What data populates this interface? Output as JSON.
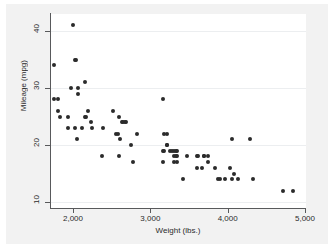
{
  "chart_data": {
    "type": "scatter",
    "title": "",
    "xlabel": "Weight (lbs.)",
    "ylabel": "Mileage (mpg)",
    "xlim": [
      1500,
      5050
    ],
    "ylim": [
      10,
      42
    ],
    "xticks": [
      2000,
      3000,
      4000,
      5000
    ],
    "xticklabels": [
      "2,000",
      "3,000",
      "4,000",
      "5,000"
    ],
    "yticks": [
      10,
      20,
      30,
      40
    ],
    "yticklabels": [
      "10",
      "20",
      "30",
      "40"
    ],
    "grid": "horizontal",
    "legend": "none",
    "marker_color": "#2b2b2b",
    "plot_background": "#ffffff",
    "graph_background": "#f2f2f2",
    "points": [
      {
        "x": 1760,
        "y": 34
      },
      {
        "x": 1760,
        "y": 28
      },
      {
        "x": 1800,
        "y": 28
      },
      {
        "x": 1800,
        "y": 26
      },
      {
        "x": 1830,
        "y": 25
      },
      {
        "x": 1930,
        "y": 25
      },
      {
        "x": 1980,
        "y": 30
      },
      {
        "x": 2000,
        "y": 41
      },
      {
        "x": 2020,
        "y": 35
      },
      {
        "x": 2040,
        "y": 35
      },
      {
        "x": 1930,
        "y": 23
      },
      {
        "x": 2020,
        "y": 23
      },
      {
        "x": 2070,
        "y": 30
      },
      {
        "x": 2070,
        "y": 29
      },
      {
        "x": 2050,
        "y": 21
      },
      {
        "x": 2110,
        "y": 23
      },
      {
        "x": 2160,
        "y": 31
      },
      {
        "x": 2160,
        "y": 25
      },
      {
        "x": 2170,
        "y": 25
      },
      {
        "x": 2200,
        "y": 26
      },
      {
        "x": 2230,
        "y": 24
      },
      {
        "x": 2240,
        "y": 23
      },
      {
        "x": 2370,
        "y": 18
      },
      {
        "x": 2390,
        "y": 23
      },
      {
        "x": 2520,
        "y": 26
      },
      {
        "x": 2560,
        "y": 22
      },
      {
        "x": 2580,
        "y": 22
      },
      {
        "x": 2600,
        "y": 25
      },
      {
        "x": 2610,
        "y": 21
      },
      {
        "x": 2640,
        "y": 24
      },
      {
        "x": 2650,
        "y": 24
      },
      {
        "x": 2670,
        "y": 24
      },
      {
        "x": 2690,
        "y": 24
      },
      {
        "x": 2600,
        "y": 18
      },
      {
        "x": 2750,
        "y": 20
      },
      {
        "x": 2780,
        "y": 17
      },
      {
        "x": 2830,
        "y": 22
      },
      {
        "x": 3170,
        "y": 28
      },
      {
        "x": 3180,
        "y": 22
      },
      {
        "x": 3210,
        "y": 22
      },
      {
        "x": 3170,
        "y": 19
      },
      {
        "x": 3180,
        "y": 19
      },
      {
        "x": 3210,
        "y": 20
      },
      {
        "x": 3220,
        "y": 20
      },
      {
        "x": 3170,
        "y": 17
      },
      {
        "x": 3260,
        "y": 19
      },
      {
        "x": 3280,
        "y": 19
      },
      {
        "x": 3300,
        "y": 19
      },
      {
        "x": 3330,
        "y": 19
      },
      {
        "x": 3350,
        "y": 19
      },
      {
        "x": 3310,
        "y": 18
      },
      {
        "x": 3330,
        "y": 18
      },
      {
        "x": 3350,
        "y": 18
      },
      {
        "x": 3310,
        "y": 17
      },
      {
        "x": 3350,
        "y": 17
      },
      {
        "x": 3420,
        "y": 14
      },
      {
        "x": 3470,
        "y": 18
      },
      {
        "x": 3600,
        "y": 18
      },
      {
        "x": 3620,
        "y": 18
      },
      {
        "x": 3690,
        "y": 18
      },
      {
        "x": 3700,
        "y": 18
      },
      {
        "x": 3740,
        "y": 18
      },
      {
        "x": 3600,
        "y": 16
      },
      {
        "x": 3670,
        "y": 16
      },
      {
        "x": 3740,
        "y": 17
      },
      {
        "x": 3830,
        "y": 16
      },
      {
        "x": 3880,
        "y": 14
      },
      {
        "x": 3900,
        "y": 14
      },
      {
        "x": 3960,
        "y": 14
      },
      {
        "x": 4060,
        "y": 21
      },
      {
        "x": 4030,
        "y": 16
      },
      {
        "x": 4080,
        "y": 15
      },
      {
        "x": 4060,
        "y": 14
      },
      {
        "x": 4130,
        "y": 14
      },
      {
        "x": 4290,
        "y": 21
      },
      {
        "x": 4330,
        "y": 14
      },
      {
        "x": 4720,
        "y": 12
      },
      {
        "x": 4840,
        "y": 12
      }
    ]
  }
}
